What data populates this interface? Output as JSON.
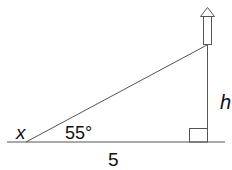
{
  "diagram": {
    "type": "right-triangle-elevation",
    "labels": {
      "angle_vertex": "x",
      "angle_value": "55°",
      "base_length": "5",
      "height": "h"
    },
    "object": "rocket",
    "colors": {
      "line": "#555555",
      "text": "#111111",
      "background": "#ffffff"
    }
  }
}
